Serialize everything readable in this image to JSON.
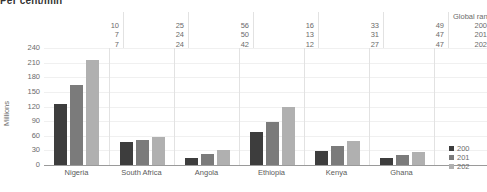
{
  "title": "Per cent/min",
  "chart_data": {
    "type": "bar",
    "title": "Per cent/min",
    "xlabel": "",
    "ylabel": "Millions",
    "ylim": [
      0,
      240
    ],
    "yticks": [
      240,
      210,
      180,
      150,
      120,
      90,
      60,
      30,
      0
    ],
    "grid": true,
    "legend_position": "right",
    "categories": [
      "Nigeria",
      "South Africa",
      "Angola",
      "Ethiopia",
      "Kenya",
      "Ghana"
    ],
    "series": [
      {
        "name": "200",
        "color": "#3d3d3d",
        "values": [
          125,
          48,
          15,
          67,
          29,
          15
        ]
      },
      {
        "name": "201",
        "color": "#7b7b7b",
        "values": [
          165,
          52,
          22,
          89,
          39,
          21
        ]
      },
      {
        "name": "202",
        "color": "#b0b0b0",
        "values": [
          215,
          58,
          31,
          118,
          50,
          27
        ]
      }
    ],
    "annotations": {
      "header_label": "Global rankin",
      "row_labels": [
        "200",
        "201",
        "202"
      ],
      "rankings": {
        "Nigeria": [
          10,
          7,
          7
        ],
        "South Africa": [
          25,
          24,
          24
        ],
        "Angola": [
          56,
          50,
          42
        ],
        "Ethiopia": [
          16,
          13,
          12
        ],
        "Kenya": [
          33,
          31,
          27
        ],
        "Ghana": [
          49,
          47,
          47
        ]
      }
    }
  },
  "ranking_table": {
    "header": "Global rankin",
    "columns": [
      {
        "country": "Nigeria",
        "values": [
          "10",
          "7",
          "7"
        ]
      },
      {
        "country": "South Africa",
        "values": [
          "25",
          "24",
          "24"
        ]
      },
      {
        "country": "Angola",
        "values": [
          "56",
          "50",
          "42"
        ]
      },
      {
        "country": "Ethiopia",
        "values": [
          "16",
          "13",
          "12"
        ]
      },
      {
        "country": "Kenya",
        "values": [
          "33",
          "31",
          "27"
        ]
      },
      {
        "country": "Ghana",
        "values": [
          "49",
          "47",
          "47"
        ]
      }
    ],
    "year_rows": [
      "200",
      "201",
      "202"
    ]
  },
  "axis": {
    "ylabel": "Millions",
    "yticks": [
      "240",
      "210",
      "180",
      "150",
      "120",
      "90",
      "60",
      "30",
      "0"
    ],
    "categories": [
      "Nigeria",
      "South Africa",
      "Angola",
      "Ethiopia",
      "Kenya",
      "Ghana"
    ]
  },
  "legend": {
    "items": [
      {
        "label": "200",
        "color": "#3d3d3d"
      },
      {
        "label": "201",
        "color": "#7b7b7b"
      },
      {
        "label": "202",
        "color": "#b0b0b0"
      }
    ]
  }
}
